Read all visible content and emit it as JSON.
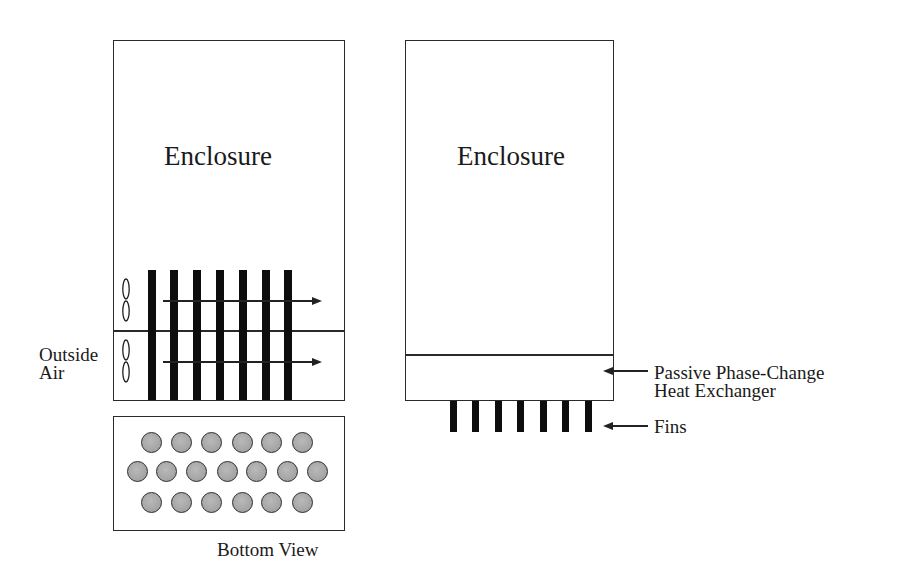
{
  "left_diagram": {
    "enclosure_label": "Enclosure",
    "inlet_label_line1": "Outside",
    "inlet_label_line2": "Air",
    "fan_count": 2,
    "tube_count": 7,
    "airflow_arrows": 2
  },
  "bottom_view": {
    "label": "Bottom View",
    "rows": [
      6,
      7,
      6
    ],
    "circle_fill": "#a8a8a8"
  },
  "right_diagram": {
    "enclosure_label": "Enclosure",
    "heat_exchanger_label_line1": "Passive Phase-Change",
    "heat_exchanger_label_line2": "Heat Exchanger",
    "fins_label": "Fins",
    "fin_count": 7
  },
  "colors": {
    "line": "#2a2a2a",
    "bars": "#0d0d0d",
    "background": "#ffffff"
  }
}
